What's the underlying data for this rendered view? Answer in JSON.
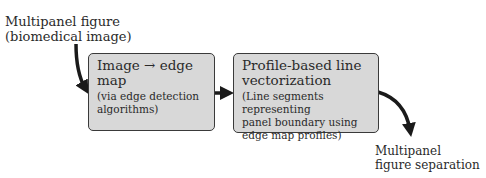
{
  "input": {
    "line1": "Multipanel figure",
    "line2": "(biomedical image)"
  },
  "steps": [
    {
      "title": "Image → edge map",
      "sub_lines": [
        "(via edge detection",
        "algorithms)"
      ]
    },
    {
      "title_lines": [
        "Profile-based line",
        "vectorization"
      ],
      "sub_lines": [
        "(Line segments representing",
        "panel boundary using",
        "edge map profiles)"
      ]
    }
  ],
  "output": {
    "line1": "Multipanel",
    "line2": "figure separation"
  },
  "colors": {
    "box_fill": "#d8d8d8",
    "box_border": "#3a3a3a",
    "arrow": "#1a1a1a",
    "text": "#2a2a2a"
  }
}
